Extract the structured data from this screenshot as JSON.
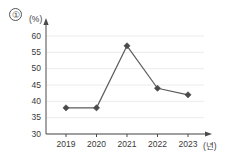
{
  "item_marker": "①",
  "axes": {
    "y_unit_label": "(%)",
    "x_unit_label": "(년)"
  },
  "chart_data": {
    "type": "line",
    "title": "",
    "subtitle": "",
    "xlabel": "(년)",
    "ylabel": "(%)",
    "categories": [
      "2019",
      "2020",
      "2021",
      "2022",
      "2023"
    ],
    "values": [
      38,
      38,
      57,
      44,
      42
    ],
    "series": [
      {
        "name": "",
        "values": [
          38,
          38,
          57,
          44,
          42
        ]
      }
    ],
    "ylim": [
      30,
      60
    ],
    "ytick_labels": [
      "30",
      "35",
      "40",
      "45",
      "50",
      "55",
      "60"
    ],
    "yticks": [
      30,
      35,
      40,
      45,
      50,
      55,
      60
    ],
    "xtick_labels": [
      "2019",
      "2020",
      "2021",
      "2022",
      "2023"
    ],
    "grid": true,
    "grid_axis": "y",
    "legend": false,
    "legend_position": "none",
    "marker": "diamond",
    "line_color": "#5b5b5b",
    "marker_color": "#4a4a4a",
    "grid_color": "#f0eaea",
    "axis_color": "#4a4a4a",
    "background_color": "#ffffff",
    "annotations": []
  }
}
